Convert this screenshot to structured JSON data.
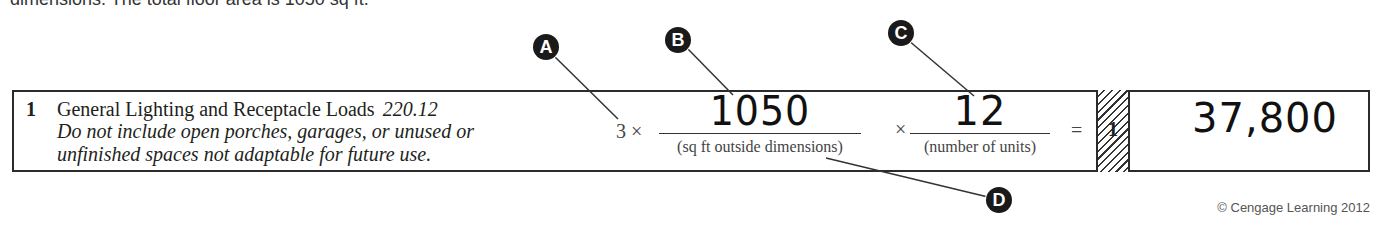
{
  "header_fragment": "dimensions. The total floor area is 1050 sq ft.",
  "row": {
    "line_number": "1",
    "title": "General Lighting and Receptacle Loads",
    "code_reference": "220.12",
    "note": "Do not include open porches, garages, or unused or unfinished spaces not adaptable for future use.",
    "multiplier_text": "3 ×",
    "sq_ft_value": "1050",
    "sq_ft_label": "(sq ft outside dimensions)",
    "times_symbol": "×",
    "units_value": "12",
    "units_label": "(number of units)",
    "equals_symbol": "=",
    "result_line_ref": "1",
    "result_value": "37,800"
  },
  "callouts": [
    {
      "letter": "A",
      "target": "multiplier 3"
    },
    {
      "letter": "B",
      "target": "sq ft value"
    },
    {
      "letter": "C",
      "target": "number of units value"
    },
    {
      "letter": "D",
      "target": "sq ft outside dimensions label"
    }
  ],
  "copyright": "© Cengage Learning 2012"
}
